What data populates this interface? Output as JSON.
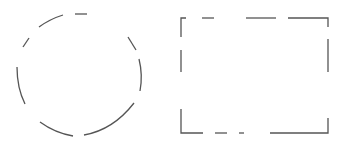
{
  "canvas": {
    "width": 343,
    "height": 142,
    "background": "#ffffff"
  },
  "stroke": {
    "color": "#555555",
    "width": 1.3
  },
  "shapes": {
    "circle": {
      "label": "dashed-circle",
      "segments": [
        "M 75 14 L 87 14",
        "M 39 27 Q 50 19 63 15",
        "M 23 47 L 29 38",
        "M 17 67 Q 17 88 25 104",
        "M 40 122 Q 55 133 73 136",
        "M 84 135 Q 113 130 134 103",
        "M 139 59 Q 143 75 140 91",
        "M 128 37 L 136 50"
      ]
    },
    "rectangle": {
      "label": "dashed-rectangle",
      "segments": [
        "M 181 37 L 181 18 L 186 18",
        "M 202 18 L 214 18",
        "M 246 18 L 276 18",
        "M 288 18 L 328 18 L 328 27",
        "M 328 39 L 328 72",
        "M 181 50 L 181 72",
        "M 181 109 L 181 133 L 203 133",
        "M 215 133 L 227 133",
        "M 239 133 L 244 133",
        "M 270 133 L 328 133 L 328 118"
      ]
    }
  }
}
